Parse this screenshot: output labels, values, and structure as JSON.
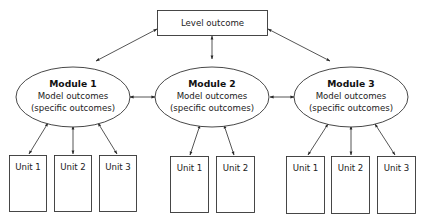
{
  "diagram": {
    "type": "hierarchy",
    "level": {
      "label": "Level outcome"
    },
    "modules": [
      {
        "title": "Module 1",
        "line1": "Model outcomes",
        "line2": "(specific outcomes)",
        "units": [
          "Unit 1",
          "Unit 2",
          "Unit 3"
        ]
      },
      {
        "title": "Module 2",
        "line1": "Model outcomes",
        "line2": "(specific outcomes)",
        "units": [
          "Unit 1",
          "Unit 2"
        ]
      },
      {
        "title": "Module 3",
        "line1": "Model outcomes",
        "line2": "(specific outcomes)",
        "units": [
          "Unit 1",
          "Unit 2",
          "Unit 3"
        ]
      }
    ],
    "edges": [
      [
        "Level outcome",
        "Module 1"
      ],
      [
        "Level outcome",
        "Module 2"
      ],
      [
        "Level outcome",
        "Module 3"
      ],
      [
        "Module 1",
        "Module 2"
      ],
      [
        "Module 2",
        "Module 3"
      ],
      [
        "Module 1",
        "Unit 1"
      ],
      [
        "Module 1",
        "Unit 2"
      ],
      [
        "Module 1",
        "Unit 3"
      ],
      [
        "Module 2",
        "Unit 1"
      ],
      [
        "Module 2",
        "Unit 2"
      ],
      [
        "Module 3",
        "Unit 1"
      ],
      [
        "Module 3",
        "Unit 2"
      ],
      [
        "Module 3",
        "Unit 3"
      ]
    ],
    "edge_style": "bidirectional-arrow"
  }
}
